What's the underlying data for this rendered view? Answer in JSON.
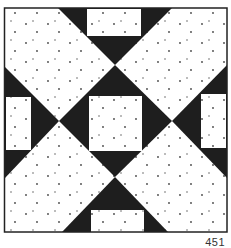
{
  "figure": {
    "title": "",
    "caption_number": "451",
    "colors": {
      "dark": "#1e1e1e",
      "light": "#ffffff",
      "dot": "#444444",
      "border": "#222222"
    }
  }
}
